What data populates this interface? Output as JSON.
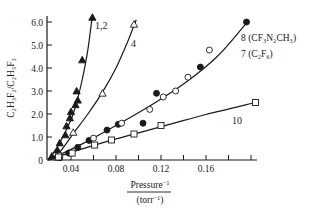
{
  "chart_data": {
    "type": "scatter",
    "title": "",
    "xlabel": "Pressure⁻¹ (torr⁻¹)",
    "xlabel_numerator": "Pressure",
    "xlabel_numerator_sup": "−1",
    "xlabel_denominator": "(torr",
    "xlabel_denominator_sup": "−1",
    "xlabel_denominator_close": ")",
    "ylabel": "C₂H₃F₂/C₂H₃F₃",
    "xlim": [
      0.02,
      0.205
    ],
    "ylim": [
      0,
      6.3
    ],
    "x_ticks": [
      0.04,
      0.06,
      0.08,
      0.1,
      0.12,
      0.14,
      0.16,
      0.18,
      0.2
    ],
    "x_tick_labels": [
      {
        "value": 0.04,
        "label": "0.04"
      },
      {
        "value": 0.08,
        "label": "0.08"
      },
      {
        "value": 0.12,
        "label": "0.12"
      },
      {
        "value": 0.16,
        "label": "0.16"
      }
    ],
    "y_ticks": [
      {
        "value": 0,
        "label": "0"
      },
      {
        "value": 1.0,
        "label": "1.0"
      },
      {
        "value": 2.0,
        "label": "2.0"
      },
      {
        "value": 3.0,
        "label": "3.0"
      },
      {
        "value": 4.0,
        "label": "4.0"
      },
      {
        "value": 5.0,
        "label": "5.0"
      },
      {
        "value": 6.0,
        "label": "6.0"
      }
    ],
    "grid": false,
    "series": [
      {
        "name": "1,2",
        "label": "1,2",
        "marker": "filled-triangle",
        "points": [
          [
            0.023,
            0.17
          ],
          [
            0.028,
            0.43
          ],
          [
            0.03,
            0.74
          ],
          [
            0.035,
            1.09
          ],
          [
            0.036,
            1.48
          ],
          [
            0.039,
            1.83
          ],
          [
            0.04,
            2.1
          ],
          [
            0.044,
            2.4
          ],
          [
            0.046,
            2.6
          ],
          [
            0.045,
            3.0
          ],
          [
            0.05,
            4.35
          ],
          [
            0.059,
            6.2
          ]
        ],
        "curve": [
          [
            0.02,
            0.0
          ],
          [
            0.03,
            0.75
          ],
          [
            0.04,
            1.75
          ],
          [
            0.045,
            2.5
          ],
          [
            0.05,
            3.5
          ],
          [
            0.055,
            4.8
          ],
          [
            0.059,
            6.3
          ]
        ]
      },
      {
        "name": "4",
        "label": "4",
        "marker": "open-triangle",
        "points": [
          [
            0.028,
            0.13
          ],
          [
            0.042,
            1.2
          ],
          [
            0.068,
            2.9
          ],
          [
            0.096,
            5.9
          ]
        ],
        "curve": [
          [
            0.02,
            0.0
          ],
          [
            0.03,
            0.35
          ],
          [
            0.042,
            1.15
          ],
          [
            0.055,
            2.0
          ],
          [
            0.068,
            2.95
          ],
          [
            0.08,
            4.0
          ],
          [
            0.09,
            5.1
          ],
          [
            0.098,
            6.1
          ]
        ]
      },
      {
        "name": "8 (CF₃N₂CH₃)",
        "label": "8 (CF₃N₂CH₃)",
        "marker": "filled-circle",
        "points": [
          [
            0.03,
            0.1
          ],
          [
            0.038,
            0.3
          ],
          [
            0.046,
            0.55
          ],
          [
            0.056,
            0.85
          ],
          [
            0.072,
            1.3
          ],
          [
            0.082,
            1.55
          ],
          [
            0.104,
            1.6
          ],
          [
            0.116,
            2.9
          ],
          [
            0.155,
            4.04
          ],
          [
            0.196,
            6.0
          ]
        ]
      },
      {
        "name": "7 (C₂F₆)",
        "label": "7 (C₂F₆)",
        "marker": "open-circle",
        "points": [
          [
            0.03,
            0.2
          ],
          [
            0.06,
            0.95
          ],
          [
            0.085,
            1.6
          ],
          [
            0.11,
            2.2
          ],
          [
            0.122,
            2.74
          ],
          [
            0.133,
            3.0
          ],
          [
            0.144,
            3.6
          ],
          [
            0.163,
            4.78
          ]
        ],
        "curve": [
          [
            0.02,
            0.0
          ],
          [
            0.05,
            0.7
          ],
          [
            0.08,
            1.5
          ],
          [
            0.11,
            2.35
          ],
          [
            0.14,
            3.3
          ],
          [
            0.17,
            4.5
          ],
          [
            0.195,
            5.9
          ]
        ]
      },
      {
        "name": "10",
        "label": "10",
        "marker": "open-square",
        "points": [
          [
            0.029,
            0.13
          ],
          [
            0.041,
            0.3
          ],
          [
            0.061,
            0.65
          ],
          [
            0.076,
            0.87
          ],
          [
            0.096,
            1.13
          ],
          [
            0.12,
            1.5
          ],
          [
            0.204,
            2.5
          ]
        ],
        "curve": [
          [
            0.02,
            0.0
          ],
          [
            0.04,
            0.33
          ],
          [
            0.07,
            0.78
          ],
          [
            0.1,
            1.18
          ],
          [
            0.13,
            1.58
          ],
          [
            0.16,
            1.98
          ],
          [
            0.204,
            2.5
          ]
        ]
      }
    ]
  }
}
